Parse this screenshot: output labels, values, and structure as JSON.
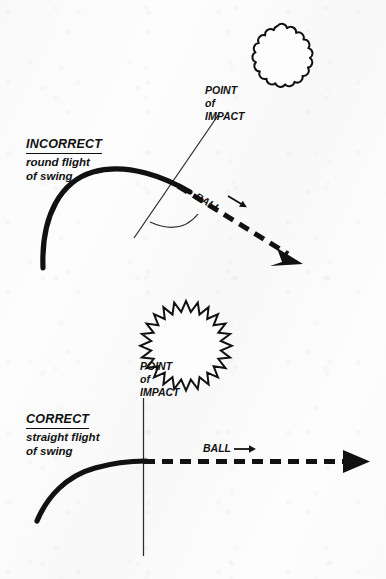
{
  "diagram": {
    "title_top": "INCORRECT",
    "title_bottom": "CORRECT",
    "panels": [
      {
        "id": "incorrect",
        "heading": "INCORRECT",
        "description_line1": "round flight",
        "description_line2": "of swing",
        "impact_label_line1": "POINT",
        "impact_label_line2": "of",
        "impact_label_line3": "IMPACT",
        "ball_label": "BALL",
        "ball_arrow_glyph": "→",
        "ball_icon": "scalloped-ball-icon",
        "swing_path_type": "round-arc",
        "ball_flight_direction": "down-right",
        "impact_line_orientation": "slanted"
      },
      {
        "id": "correct",
        "heading": "CORRECT",
        "description_line1": "straight flight",
        "description_line2": "of swing",
        "impact_label_line1": "POINT",
        "impact_label_line2": "of",
        "impact_label_line3": "IMPACT",
        "ball_label": "BALL",
        "ball_arrow_glyph": "→",
        "ball_icon": "starburst-ball-icon",
        "swing_path_type": "flattening-arc",
        "ball_flight_direction": "horizontal-right",
        "impact_line_orientation": "vertical"
      }
    ],
    "colors": {
      "ink": "#111111",
      "paper": "#fdfdfd",
      "thin_line": "#2b2b2b"
    }
  }
}
